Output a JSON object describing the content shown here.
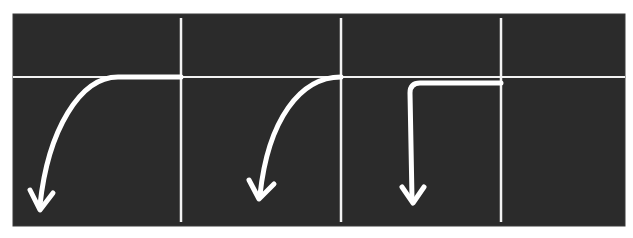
{
  "canvas": {
    "width": 633,
    "height": 238,
    "background": "#ffffff"
  },
  "panel": {
    "x": 13,
    "y": 14,
    "width": 612,
    "height": 212,
    "fill": "#2b2b2b",
    "border": "#3a3a3a"
  },
  "colors": {
    "line": "#f2f2f2",
    "trace": "#ffffff"
  },
  "baseline": {
    "x1": 13,
    "x2": 625,
    "y": 77,
    "stroke_width": 2
  },
  "grid_lines": [
    {
      "x": 181,
      "y1": 18,
      "y2": 222
    },
    {
      "x": 341,
      "y1": 18,
      "y2": 222
    },
    {
      "x": 501,
      "y1": 18,
      "y2": 222
    }
  ],
  "traces": [
    {
      "name": "trace-1-gradual-curve",
      "path": "M 181 77 L 118 77 C 80 77 48 130 40 205",
      "arrow_tip": [
        40,
        210
      ],
      "arrow_left": [
        30,
        190
      ],
      "arrow_right": [
        53,
        193
      ]
    },
    {
      "name": "trace-2-curve",
      "path": "M 341 77 C 300 77 268 120 260 195",
      "arrow_tip": [
        259,
        199
      ],
      "arrow_left": [
        249,
        180
      ],
      "arrow_right": [
        274,
        184
      ]
    },
    {
      "name": "trace-3-step",
      "path": "M 501 83 L 420 83 Q 410 83 410 93 L 412 198",
      "arrow_tip": [
        413,
        203
      ],
      "arrow_left": [
        402,
        187
      ],
      "arrow_right": [
        424,
        187
      ]
    }
  ],
  "trace_stroke_width": 5
}
